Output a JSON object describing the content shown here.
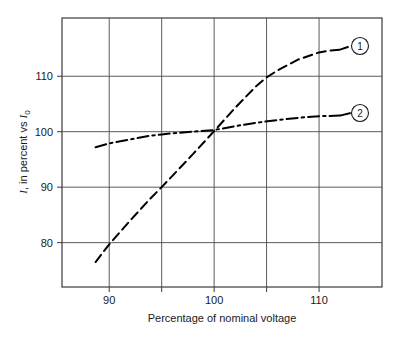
{
  "chart_data": {
    "type": "line",
    "title": "",
    "subtitle": "",
    "xlabel": "Percentage of nominal voltage",
    "ylabel": "I, in percent vs I0",
    "ylabel_parts": {
      "symbol": "I",
      "middle": ", in percent vs ",
      "ref_symbol": "I",
      "ref_subscript": "0"
    },
    "xlim": [
      85.5,
      116
    ],
    "ylim": [
      72,
      120.5
    ],
    "x_ticks": [
      90,
      95,
      100,
      105,
      110
    ],
    "x_tick_labels": [
      "90",
      "",
      "100",
      "",
      "110"
    ],
    "y_ticks": [
      80,
      90,
      100,
      110
    ],
    "y_tick_labels": [
      "80",
      "90",
      "100",
      "110"
    ],
    "grid": "both",
    "legend_position": "inline-right-end-labels",
    "series": [
      {
        "name": "1",
        "badge_label": "1",
        "linestyle": "dashed",
        "color": "#000000",
        "x": [
          88.7,
          90.0,
          92.0,
          94.0,
          95.0,
          96.0,
          98.0,
          100.0,
          102.0,
          104.0,
          105.0,
          106.0,
          108.0,
          110.0,
          111.0,
          112.0
        ],
        "y": [
          76.5,
          79.7,
          84.0,
          88.1,
          90.0,
          92.0,
          96.0,
          100.1,
          104.3,
          108.2,
          109.8,
          111.0,
          113.0,
          114.3,
          114.6,
          114.8
        ]
      },
      {
        "name": "2",
        "badge_label": "2",
        "linestyle": "dash-dot",
        "color": "#000000",
        "x": [
          88.7,
          90.0,
          92.0,
          94.0,
          95.0,
          96.0,
          98.0,
          100.0,
          102.0,
          104.0,
          106.0,
          108.0,
          110.0,
          112.0
        ],
        "y": [
          97.2,
          97.9,
          98.6,
          99.3,
          99.5,
          99.7,
          100.0,
          100.3,
          101.0,
          101.6,
          102.1,
          102.5,
          102.8,
          102.9
        ]
      }
    ],
    "series_badges": [
      {
        "label": "1",
        "x_px": 360,
        "y_px": 46
      },
      {
        "label": "2",
        "x_px": 360,
        "y_px": 113
      }
    ]
  }
}
